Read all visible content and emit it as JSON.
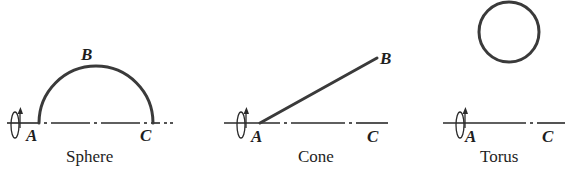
{
  "figure": {
    "panels": [
      {
        "id": "sphere",
        "caption": "Sphere",
        "curve_type": "semicircle",
        "points": {
          "a": "A",
          "b": "B",
          "c": "C"
        },
        "axis_style": "dash-dot",
        "rotation_icon": "rotation-arrow-icon"
      },
      {
        "id": "cone",
        "caption": "Cone",
        "curve_type": "straight-line",
        "points": {
          "a": "A",
          "b": "B",
          "c": "C"
        },
        "axis_style": "dash-dot",
        "rotation_icon": "rotation-arrow-icon"
      },
      {
        "id": "torus",
        "caption": "Torus",
        "curve_type": "circle",
        "points": {
          "a": "A",
          "c": "C"
        },
        "axis_style": "dash-dot",
        "rotation_icon": "rotation-arrow-icon"
      }
    ],
    "colors": {
      "curve": "#3a3a3a",
      "axis": "#2a2a2a",
      "text": "#1e1e1e",
      "background": "#ffffff"
    }
  }
}
